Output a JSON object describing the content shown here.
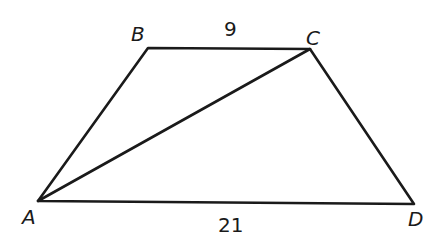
{
  "diagram": {
    "type": "trapezoid",
    "vertices": {
      "A": {
        "label": "A",
        "x": 38,
        "y": 201
      },
      "B": {
        "label": "B",
        "x": 148,
        "y": 48
      },
      "C": {
        "label": "C",
        "x": 310,
        "y": 49
      },
      "D": {
        "label": "D",
        "x": 414,
        "y": 204
      }
    },
    "edges": [
      {
        "from": "A",
        "to": "B"
      },
      {
        "from": "B",
        "to": "C",
        "length_label": "9"
      },
      {
        "from": "C",
        "to": "D"
      },
      {
        "from": "A",
        "to": "D",
        "length_label": "21"
      },
      {
        "from": "A",
        "to": "C",
        "kind": "diagonal"
      }
    ],
    "labels": {
      "A": "A",
      "B": "B",
      "C": "C",
      "D": "D",
      "bc_length": "9",
      "ad_length": "21"
    },
    "stroke_color": "#1a1a1a",
    "background": "#ffffff"
  }
}
